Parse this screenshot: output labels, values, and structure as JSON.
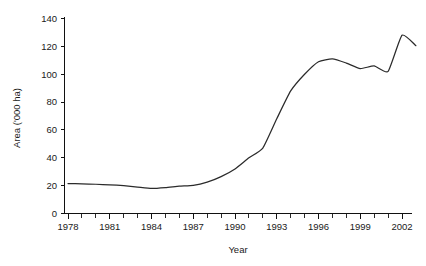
{
  "chart_data": {
    "type": "line",
    "title": "",
    "xlabel": "Year",
    "ylabel": "Area ('000 ha)",
    "xlim": [
      1978,
      2003
    ],
    "ylim": [
      0,
      140
    ],
    "yticks": [
      0,
      20,
      40,
      60,
      80,
      100,
      120,
      140
    ],
    "ytick_labels": [
      "0",
      "20",
      "40",
      "60",
      "80",
      "100",
      "120",
      "140"
    ],
    "xticks": [
      1978,
      1979,
      1980,
      1981,
      1982,
      1983,
      1984,
      1985,
      1986,
      1987,
      1988,
      1989,
      1990,
      1991,
      1992,
      1993,
      1994,
      1995,
      1996,
      1997,
      1998,
      1999,
      2000,
      2001,
      2002,
      2003
    ],
    "xtick_labels_shown": [
      "1978",
      "1981",
      "1984",
      "1987",
      "1990",
      "1993",
      "1996",
      "1999",
      "2002"
    ],
    "xtick_label_years": [
      1978,
      1981,
      1984,
      1987,
      1990,
      1993,
      1996,
      1999,
      2002
    ],
    "grid": false,
    "legend": false,
    "line_color": "#2b2b2b",
    "series": [
      {
        "name": "Area",
        "x": [
          1978,
          1979,
          1980,
          1981,
          1982,
          1983,
          1984,
          1985,
          1986,
          1987,
          1988,
          1989,
          1990,
          1991,
          1992,
          1993,
          1994,
          1995,
          1996,
          1997,
          1998,
          1999,
          2000,
          2001,
          2002,
          2003
        ],
        "values": [
          21.5,
          21.3,
          21.0,
          20.6,
          20.0,
          19.0,
          18.0,
          18.6,
          19.6,
          20.2,
          22.5,
          26.5,
          32.0,
          40.0,
          47.0,
          68.0,
          88.0,
          100.0,
          109.0,
          111.0,
          108.0,
          104.0,
          106.0,
          102.0,
          128.0,
          131.0
        ],
        "values_extended": [
          21.5,
          21.3,
          21.0,
          20.6,
          20.0,
          19.0,
          18.0,
          18.6,
          19.6,
          20.2,
          22.5,
          26.5,
          32.0,
          40.0,
          47.0,
          68.0,
          88.0,
          100.0,
          109.0,
          111.0,
          108.0,
          104.0,
          106.0,
          102.0,
          128.0,
          120.5
        ]
      }
    ]
  },
  "axes": {
    "y_axis_title": "Area ('000 ha)",
    "x_axis_title": "Year"
  }
}
